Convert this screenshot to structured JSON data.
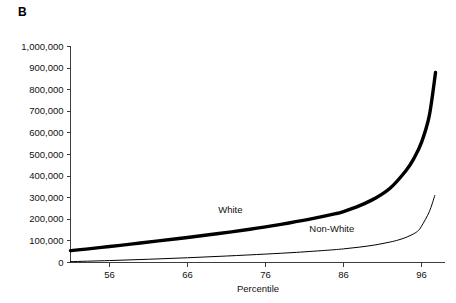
{
  "figure": {
    "panel_label": "B"
  },
  "chart_data": {
    "type": "line",
    "title": "",
    "subtitle": "",
    "xlabel": "Percentile",
    "ylabel": "",
    "xlim": [
      51,
      99
    ],
    "ylim": [
      0,
      1000000
    ],
    "grid": false,
    "legend_position": "inline-annotation",
    "x_ticks": [
      56,
      66,
      76,
      86,
      96
    ],
    "x_tick_labels": [
      "56",
      "66",
      "76",
      "86",
      "96"
    ],
    "y_ticks": [
      0,
      100000,
      200000,
      300000,
      400000,
      500000,
      600000,
      700000,
      800000,
      900000,
      1000000
    ],
    "y_tick_labels": [
      "0",
      "100,000",
      "200,000",
      "300,000",
      "400,000",
      "500,000",
      "600,000",
      "700,000",
      "800,000",
      "900,000",
      "1,000,000"
    ],
    "annotations": [
      {
        "text": "White",
        "x": 71.5,
        "y": 228000
      },
      {
        "text": "Non-White",
        "x": 84.5,
        "y": 143000
      }
    ],
    "series": [
      {
        "name": "White",
        "color": "#000000",
        "line_width": 3.4,
        "x": [
          51,
          53,
          56,
          59,
          62,
          66,
          70,
          74,
          76,
          79,
          82,
          85,
          86,
          88,
          90,
          92,
          94,
          95,
          96,
          97,
          97.8
        ],
        "values": [
          55000,
          62000,
          74000,
          86000,
          99000,
          116000,
          134000,
          154000,
          165000,
          183000,
          203000,
          226000,
          236000,
          262000,
          296000,
          345000,
          425000,
          480000,
          556000,
          680000,
          880000
        ]
      },
      {
        "name": "Non-White",
        "color": "#000000",
        "line_width": 1.0,
        "x": [
          51,
          56,
          61,
          66,
          71,
          76,
          80,
          84,
          86,
          88,
          90,
          92,
          93,
          94,
          95,
          95.6,
          96,
          97,
          97.7
        ],
        "values": [
          4000,
          9000,
          15000,
          22000,
          30000,
          39000,
          47000,
          57000,
          63000,
          71000,
          81000,
          95000,
          104000,
          116000,
          133000,
          148000,
          168000,
          235000,
          310000
        ]
      }
    ]
  }
}
